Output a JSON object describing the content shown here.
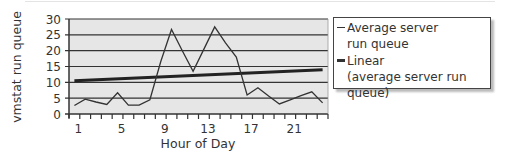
{
  "chart_data": {
    "type": "line",
    "title": "",
    "xlabel": "Hour of Day",
    "ylabel": "vmstat run queue",
    "ylim": [
      0,
      30
    ],
    "yticks": [
      0,
      5,
      10,
      15,
      20,
      25,
      30
    ],
    "xtick_labels": [
      "1",
      "5",
      "9",
      "13",
      "17",
      "21"
    ],
    "grid": true,
    "legend_position": "right",
    "x": [
      1,
      2,
      3,
      4,
      5,
      6,
      7,
      8,
      9,
      10,
      11,
      12,
      13,
      14,
      15,
      16,
      17,
      18,
      19,
      20,
      21,
      22,
      23,
      24
    ],
    "series": [
      {
        "name": "Average server run queue",
        "values": [
          2.7,
          4.7,
          3.8,
          3.0,
          6.7,
          2.8,
          2.8,
          4.5,
          16.5,
          26.7,
          20.0,
          13.5,
          20.5,
          27.5,
          22.5,
          18.0,
          6.0,
          8.3,
          5.7,
          3.2,
          4.5,
          5.8,
          7.0,
          3.5
        ]
      },
      {
        "name": "Linear (average server run queue)",
        "type": "trendline",
        "values_endpoints": [
          10.5,
          14.0
        ]
      }
    ]
  },
  "axis": {
    "y_title": "vmstat run queue",
    "x_title": "Hour of Day",
    "y_ticks": [
      "0",
      "5",
      "10",
      "15",
      "20",
      "25",
      "30"
    ],
    "x_ticks": [
      "1",
      "5",
      "9",
      "13",
      "17",
      "21"
    ]
  },
  "legend": {
    "items": [
      {
        "label_line1": "Average server",
        "label_line2": "run queue"
      },
      {
        "label_line1": "Linear",
        "label_line2": "(average server run queue)"
      }
    ]
  },
  "colors": {
    "plot_bg": "#e6e6e6",
    "grid": "#333333",
    "series": "#333333",
    "trend": "#222222"
  }
}
